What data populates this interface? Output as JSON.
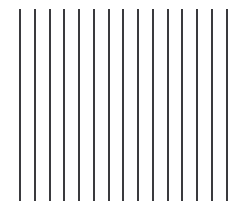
{
  "figure": {
    "width": 248,
    "height": 210,
    "background_color": "#ffffff"
  },
  "chart_data": {
    "type": "bar",
    "title": "",
    "subtitle": "",
    "xlabel": "",
    "ylabel": "",
    "grid": false,
    "legend": null,
    "axis_visible": false,
    "tick_labels_x": [],
    "tick_labels_y": [],
    "xlim": [
      0,
      15
    ],
    "ylim": [
      0,
      1
    ],
    "series_color": "#3a3a3e",
    "bar_width_px": 2,
    "categories": [
      "1",
      "2",
      "3",
      "4",
      "5",
      "6",
      "7",
      "8",
      "9",
      "10",
      "11",
      "12",
      "13",
      "14",
      "15"
    ],
    "values": [
      1,
      1,
      1,
      1,
      1,
      1,
      1,
      1,
      1,
      1,
      1,
      1,
      1,
      1,
      1
    ],
    "bars": [
      {
        "index": 1,
        "x_px": 19,
        "top_px": 9,
        "bottom_px": 201,
        "width_px": 2,
        "color": "#3a3a3e"
      },
      {
        "index": 2,
        "x_px": 34,
        "top_px": 9,
        "bottom_px": 201,
        "width_px": 2,
        "color": "#3a3a3e"
      },
      {
        "index": 3,
        "x_px": 49,
        "top_px": 9,
        "bottom_px": 201,
        "width_px": 2,
        "color": "#3a3a3e"
      },
      {
        "index": 4,
        "x_px": 63,
        "top_px": 9,
        "bottom_px": 201,
        "width_px": 2,
        "color": "#3a3a3e"
      },
      {
        "index": 5,
        "x_px": 78,
        "top_px": 9,
        "bottom_px": 201,
        "width_px": 2,
        "color": "#3a3a3e"
      },
      {
        "index": 6,
        "x_px": 93,
        "top_px": 9,
        "bottom_px": 201,
        "width_px": 2,
        "color": "#3a3a3e"
      },
      {
        "index": 7,
        "x_px": 108,
        "top_px": 9,
        "bottom_px": 201,
        "width_px": 2,
        "color": "#3a3a3e"
      },
      {
        "index": 8,
        "x_px": 122,
        "top_px": 9,
        "bottom_px": 201,
        "width_px": 2,
        "color": "#3a3a3e"
      },
      {
        "index": 9,
        "x_px": 137,
        "top_px": 9,
        "bottom_px": 201,
        "width_px": 2,
        "color": "#3a3a3e"
      },
      {
        "index": 10,
        "x_px": 152,
        "top_px": 9,
        "bottom_px": 201,
        "width_px": 2,
        "color": "#3a3a3e"
      },
      {
        "index": 11,
        "x_px": 167,
        "top_px": 9,
        "bottom_px": 201,
        "width_px": 2,
        "color": "#3a3a3e"
      },
      {
        "index": 12,
        "x_px": 181,
        "top_px": 9,
        "bottom_px": 201,
        "width_px": 2,
        "color": "#3a3a3e"
      },
      {
        "index": 13,
        "x_px": 196,
        "top_px": 9,
        "bottom_px": 201,
        "width_px": 2,
        "color": "#3a3a3e"
      },
      {
        "index": 14,
        "x_px": 211,
        "top_px": 9,
        "bottom_px": 201,
        "width_px": 2,
        "color": "#3a3a3e"
      },
      {
        "index": 15,
        "x_px": 226,
        "top_px": 9,
        "bottom_px": 201,
        "width_px": 2,
        "color": "#3a3a3e"
      }
    ]
  }
}
